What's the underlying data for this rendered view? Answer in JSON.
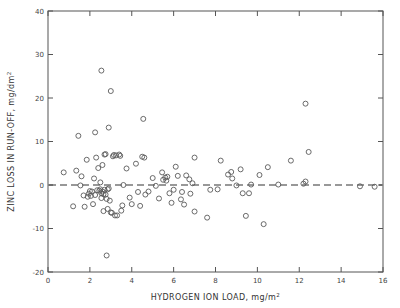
{
  "chart_data": {
    "type": "scatter",
    "title": "",
    "xlabel": "HYDROGEN ION LOAD, mg/m2",
    "xlabel_main": "HYDROGEN ION LOAD, mg/m",
    "xlabel_sup": "2",
    "ylabel": "ZINC LOSS IN RUN-OFF, mg/dm2",
    "ylabel_main": "ZINC LOSS IN RUN-OFF, mg/dm",
    "ylabel_sup": "2",
    "xlim": [
      0,
      16
    ],
    "ylim": [
      -20,
      40
    ],
    "xticks": [
      0,
      2,
      4,
      6,
      8,
      10,
      12,
      14,
      16
    ],
    "xticklabels": [
      "0",
      "2",
      "4",
      "6",
      "8",
      "10",
      "12",
      "14",
      "16"
    ],
    "yticks": [
      -20,
      -10,
      0,
      10,
      20,
      30,
      40
    ],
    "yticklabels": [
      "-20",
      "-10",
      "0",
      "10",
      "20",
      "30",
      "40"
    ],
    "grid": false,
    "legend": null,
    "marker": "open-circle",
    "marker_color": "#5a5a5a",
    "reference_line": {
      "y": 0,
      "style": "dashed",
      "color": "#333333"
    },
    "points": [
      [
        1.45,
        11.3
      ],
      [
        2.25,
        12.1
      ],
      [
        2.55,
        26.3
      ],
      [
        3.0,
        21.6
      ],
      [
        2.9,
        13.2
      ],
      [
        4.55,
        15.2
      ],
      [
        12.3,
        18.7
      ],
      [
        0.75,
        2.9
      ],
      [
        1.2,
        -4.9
      ],
      [
        1.35,
        3.3
      ],
      [
        1.55,
        -0.1
      ],
      [
        1.6,
        2.0
      ],
      [
        1.7,
        -2.4
      ],
      [
        1.75,
        -5.0
      ],
      [
        1.85,
        5.8
      ],
      [
        1.9,
        -2.7
      ],
      [
        1.95,
        -2.0
      ],
      [
        2.0,
        -1.4
      ],
      [
        2.05,
        -2.5
      ],
      [
        2.1,
        -1.5
      ],
      [
        2.15,
        -4.4
      ],
      [
        2.2,
        1.5
      ],
      [
        2.25,
        -2.3
      ],
      [
        2.3,
        6.3
      ],
      [
        2.35,
        -1.2
      ],
      [
        2.4,
        3.9
      ],
      [
        2.45,
        -1.3
      ],
      [
        2.5,
        -1.0
      ],
      [
        2.5,
        0.6
      ],
      [
        2.55,
        -1.9
      ],
      [
        2.55,
        -3.0
      ],
      [
        2.6,
        -1.5
      ],
      [
        2.6,
        4.6
      ],
      [
        2.65,
        -2.1
      ],
      [
        2.65,
        -6.0
      ],
      [
        2.7,
        -1.1
      ],
      [
        2.7,
        7.0
      ],
      [
        2.75,
        -2.2
      ],
      [
        2.75,
        7.1
      ],
      [
        2.8,
        -3.2
      ],
      [
        2.8,
        -16.2
      ],
      [
        2.85,
        -1.0
      ],
      [
        2.85,
        -5.5
      ],
      [
        2.9,
        -0.8
      ],
      [
        2.95,
        -3.6
      ],
      [
        3.0,
        -6.3
      ],
      [
        3.05,
        -6.4
      ],
      [
        3.1,
        6.6
      ],
      [
        3.15,
        6.9
      ],
      [
        3.2,
        -7.0
      ],
      [
        3.25,
        6.8
      ],
      [
        3.3,
        -7.0
      ],
      [
        3.4,
        7.0
      ],
      [
        3.45,
        6.7
      ],
      [
        3.5,
        -5.9
      ],
      [
        3.55,
        -4.7
      ],
      [
        3.6,
        0.0
      ],
      [
        3.75,
        3.8
      ],
      [
        3.9,
        -2.9
      ],
      [
        4.0,
        -4.4
      ],
      [
        4.2,
        4.9
      ],
      [
        4.3,
        -1.6
      ],
      [
        4.4,
        -4.8
      ],
      [
        4.5,
        6.5
      ],
      [
        4.6,
        6.3
      ],
      [
        4.65,
        -2.2
      ],
      [
        4.8,
        -1.5
      ],
      [
        5.0,
        1.6
      ],
      [
        5.15,
        -0.2
      ],
      [
        5.3,
        -3.1
      ],
      [
        5.45,
        2.9
      ],
      [
        5.5,
        1.2
      ],
      [
        5.6,
        1.7
      ],
      [
        5.65,
        1.0
      ],
      [
        5.7,
        1.9
      ],
      [
        5.8,
        -1.9
      ],
      [
        5.9,
        -4.1
      ],
      [
        6.0,
        -1.1
      ],
      [
        6.1,
        4.2
      ],
      [
        6.2,
        2.1
      ],
      [
        6.35,
        -3.3
      ],
      [
        6.4,
        -1.6
      ],
      [
        6.5,
        -4.5
      ],
      [
        6.6,
        2.2
      ],
      [
        6.75,
        1.3
      ],
      [
        6.8,
        -2.0
      ],
      [
        6.9,
        0.4
      ],
      [
        7.0,
        6.3
      ],
      [
        7.0,
        -6.1
      ],
      [
        7.6,
        -7.5
      ],
      [
        7.75,
        -1.1
      ],
      [
        8.1,
        -1.0
      ],
      [
        8.25,
        5.6
      ],
      [
        8.6,
        2.4
      ],
      [
        8.75,
        3.0
      ],
      [
        8.8,
        1.5
      ],
      [
        9.0,
        -0.1
      ],
      [
        9.2,
        3.6
      ],
      [
        9.3,
        -1.9
      ],
      [
        9.45,
        -7.1
      ],
      [
        9.6,
        -1.9
      ],
      [
        9.7,
        0.1
      ],
      [
        10.1,
        2.3
      ],
      [
        10.3,
        -9.0
      ],
      [
        10.5,
        4.1
      ],
      [
        11.0,
        0.1
      ],
      [
        11.6,
        5.6
      ],
      [
        12.2,
        0.3
      ],
      [
        12.3,
        0.8
      ],
      [
        12.45,
        7.6
      ],
      [
        15.6,
        -0.4
      ],
      [
        14.9,
        -0.3
      ]
    ]
  }
}
